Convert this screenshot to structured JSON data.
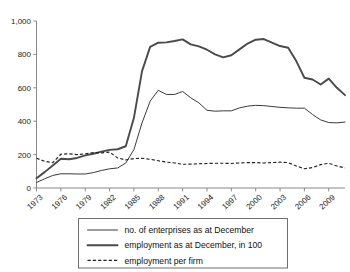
{
  "chart_data": {
    "type": "line",
    "title": "",
    "xlabel": "",
    "ylabel": "",
    "ylim": [
      0,
      1000
    ],
    "xlim": [
      1973,
      2011
    ],
    "grid": false,
    "legend_position": "bottom",
    "y_ticks": [
      "0",
      "200",
      "400",
      "600",
      "800",
      "1,000"
    ],
    "y_tick_values": [
      0,
      200,
      400,
      600,
      800,
      1000
    ],
    "x_tick_labels": [
      "1973",
      "1976",
      "1979",
      "1982",
      "1985",
      "1988",
      "1991",
      "1994",
      "1997",
      "2000",
      "2003",
      "2006",
      "2009"
    ],
    "x_tick_values": [
      1973,
      1976,
      1979,
      1982,
      1985,
      1988,
      1991,
      1994,
      1997,
      2000,
      2003,
      2006,
      2009
    ],
    "x": [
      1973,
      1974,
      1975,
      1976,
      1977,
      1978,
      1979,
      1980,
      1981,
      1982,
      1983,
      1984,
      1985,
      1986,
      1987,
      1988,
      1989,
      1990,
      1991,
      1992,
      1993,
      1994,
      1995,
      1996,
      1997,
      1998,
      1999,
      2000,
      2001,
      2002,
      2003,
      2004,
      2005,
      2006,
      2007,
      2008,
      2009,
      2010,
      2011
    ],
    "series": [
      {
        "name": "no. of enterprises as at December",
        "style": "thin",
        "values": [
          33,
          55,
          75,
          85,
          85,
          84,
          84,
          92,
          105,
          115,
          120,
          150,
          230,
          390,
          520,
          585,
          560,
          560,
          578,
          540,
          510,
          465,
          460,
          462,
          462,
          480,
          490,
          495,
          493,
          488,
          483,
          480,
          478,
          478,
          440,
          408,
          392,
          390,
          395
        ]
      },
      {
        "name": "employment as at December, in 100",
        "style": "thick",
        "values": [
          58,
          95,
          135,
          175,
          172,
          180,
          195,
          205,
          218,
          228,
          232,
          250,
          420,
          700,
          845,
          870,
          872,
          880,
          890,
          860,
          848,
          828,
          800,
          782,
          795,
          830,
          865,
          888,
          892,
          870,
          850,
          840,
          760,
          660,
          650,
          620,
          655,
          600,
          556
        ]
      },
      {
        "name": "employment per firm",
        "style": "dashed",
        "values": [
          178,
          160,
          152,
          202,
          205,
          200,
          205,
          212,
          210,
          215,
          180,
          168,
          176,
          178,
          172,
          163,
          155,
          150,
          142,
          143,
          145,
          147,
          148,
          148,
          147,
          150,
          152,
          152,
          150,
          152,
          155,
          152,
          132,
          115,
          122,
          140,
          148,
          132,
          120
        ]
      }
    ]
  },
  "legend": {
    "items": [
      {
        "label": "no. of enterprises as at December",
        "style": "thin"
      },
      {
        "label": "employment as at December, in 100",
        "style": "thick"
      },
      {
        "label": "employment per firm",
        "style": "dashed"
      }
    ]
  }
}
